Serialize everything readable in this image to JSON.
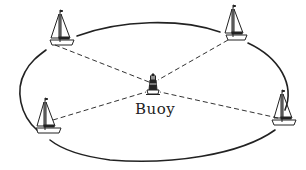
{
  "diagram": {
    "type": "race-course",
    "center_label": "Buoy",
    "colors": {
      "stroke": "#222222",
      "background": "#ffffff"
    },
    "boats": [
      {
        "id": "top-left",
        "x": 60,
        "y": 42
      },
      {
        "id": "top-right",
        "x": 233,
        "y": 37
      },
      {
        "id": "bottom-left",
        "x": 45,
        "y": 130
      },
      {
        "id": "bottom-right",
        "x": 282,
        "y": 122
      }
    ],
    "buoy": {
      "x": 153,
      "y": 88
    }
  }
}
